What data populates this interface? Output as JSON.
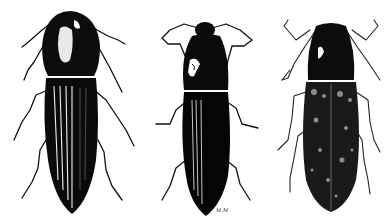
{
  "figure": {
    "specimens": [
      {
        "id": "left",
        "description": "glossy black pronotum with white highlight, striated elytra"
      },
      {
        "id": "middle",
        "description": "very dark body with short broad antennae, smooth elytra"
      },
      {
        "id": "right",
        "description": "finely stippled mottled body, long slender legs"
      }
    ],
    "signature": "M.M."
  },
  "colors": {
    "ink": "#0a0a0a",
    "paper": "#ffffff",
    "highlight": "#f2f2f2"
  }
}
